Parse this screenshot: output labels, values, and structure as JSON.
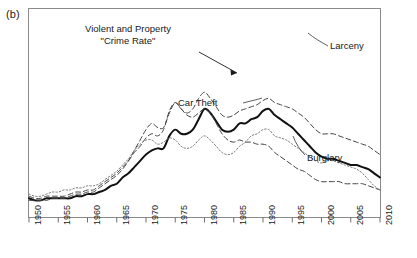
{
  "panel": {
    "label": "(b)"
  },
  "annotations": {
    "crime_rate": "Violent and Property\n\"Crime Rate\"",
    "larceny": "Larceny",
    "car_theft": "Car Theft",
    "burglary": "Burglary"
  },
  "axis": {
    "x_ticks": [
      "1950",
      "1955",
      "1960",
      "1965",
      "1970",
      "1975",
      "1980",
      "1985",
      "1990",
      "1995",
      "2000",
      "2005",
      "2010"
    ]
  },
  "colors": {
    "ink": "#1a1a1a",
    "frame": "#8a8a8a",
    "crime_rate": "#111111",
    "larceny": "#444444",
    "burglary": "#444444",
    "car_theft": "#777777"
  },
  "chart_data": {
    "type": "line",
    "title": "",
    "xlabel": "",
    "ylabel": "",
    "xlim": [
      1950,
      2010
    ],
    "ylim": [
      0,
      100
    ],
    "grid": false,
    "legend": "inline-annotations",
    "x": [
      1950,
      1951,
      1952,
      1953,
      1954,
      1955,
      1956,
      1957,
      1958,
      1959,
      1960,
      1961,
      1962,
      1963,
      1964,
      1965,
      1966,
      1967,
      1968,
      1969,
      1970,
      1971,
      1972,
      1973,
      1974,
      1975,
      1976,
      1977,
      1978,
      1979,
      1980,
      1981,
      1982,
      1983,
      1984,
      1985,
      1986,
      1987,
      1988,
      1989,
      1990,
      1991,
      1992,
      1993,
      1994,
      1995,
      1996,
      1997,
      1998,
      1999,
      2000,
      2001,
      2002,
      2003,
      2004,
      2005,
      2006,
      2007,
      2008,
      2009,
      2010
    ],
    "series": [
      {
        "name": "Violent and Property \"Crime Rate\"",
        "style": "solid",
        "values": [
          9,
          8,
          8,
          9,
          9,
          9,
          9,
          9,
          10,
          10,
          11,
          11,
          12,
          13,
          15,
          16,
          19,
          21,
          24,
          27,
          30,
          32,
          33,
          33,
          39,
          42,
          40,
          40,
          42,
          47,
          52,
          50,
          46,
          42,
          41,
          42,
          45,
          45,
          47,
          48,
          51,
          52,
          49,
          47,
          45,
          43,
          40,
          37,
          34,
          31,
          29,
          28,
          28,
          27,
          26,
          25,
          25,
          24,
          23,
          21,
          19
        ]
      },
      {
        "name": "Larceny",
        "style": "dashed",
        "values": [
          10,
          9,
          9,
          10,
          10,
          10,
          10,
          11,
          12,
          12,
          13,
          13,
          15,
          17,
          19,
          21,
          24,
          27,
          31,
          34,
          38,
          40,
          39,
          42,
          51,
          55,
          52,
          50,
          52,
          57,
          60,
          57,
          53,
          49,
          48,
          49,
          51,
          52,
          53,
          54,
          56,
          57,
          55,
          54,
          53,
          52,
          50,
          48,
          45,
          42,
          40,
          40,
          40,
          39,
          38,
          37,
          36,
          35,
          34,
          32,
          30
        ]
      },
      {
        "name": "Burglary",
        "style": "dashed",
        "values": [
          8,
          8,
          8,
          8,
          9,
          9,
          9,
          10,
          11,
          11,
          12,
          12,
          14,
          16,
          18,
          20,
          23,
          27,
          32,
          37,
          42,
          45,
          43,
          43,
          50,
          55,
          52,
          49,
          48,
          50,
          52,
          50,
          45,
          40,
          37,
          36,
          37,
          36,
          36,
          35,
          35,
          34,
          31,
          29,
          27,
          25,
          23,
          22,
          20,
          18,
          17,
          17,
          17,
          17,
          16,
          16,
          16,
          16,
          15,
          14,
          13
        ]
      },
      {
        "name": "Car Theft",
        "style": "dotted",
        "values": [
          11,
          10,
          10,
          11,
          12,
          12,
          13,
          13,
          14,
          14,
          15,
          15,
          16,
          18,
          20,
          22,
          25,
          28,
          32,
          35,
          37,
          37,
          35,
          36,
          38,
          37,
          34,
          33,
          34,
          37,
          39,
          37,
          34,
          31,
          30,
          31,
          34,
          36,
          39,
          40,
          42,
          42,
          39,
          38,
          37,
          35,
          33,
          31,
          29,
          27,
          26,
          27,
          27,
          26,
          25,
          24,
          23,
          21,
          18,
          15,
          13
        ]
      }
    ]
  }
}
